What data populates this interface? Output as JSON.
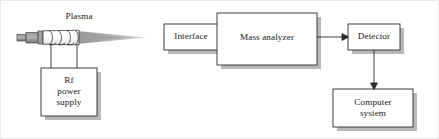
{
  "figure": {
    "background": "#ffffff",
    "line_color": "#2b2b2b",
    "shadow_color": "#b9b9b9",
    "plasma_gray": "#a8a8a8",
    "torch_gray": "#8c8c8c"
  },
  "annotations": {
    "plasma_label": "Plasma"
  },
  "blocks": [
    {
      "id": "rf-power-supply",
      "label": "Rf\npower\nsupply",
      "x": 40,
      "y": 67,
      "w": 56,
      "h": 48
    },
    {
      "id": "interface",
      "label": "Interface",
      "x": 163,
      "y": 23,
      "w": 54,
      "h": 26
    },
    {
      "id": "mass-analyzer",
      "label": "Mass analyzer",
      "x": 216,
      "y": 12,
      "w": 100,
      "h": 52
    },
    {
      "id": "detector",
      "label": "Detector",
      "x": 347,
      "y": 23,
      "w": 52,
      "h": 26
    },
    {
      "id": "computer-system",
      "label": "Computer\nsystem",
      "x": 332,
      "y": 88,
      "w": 80,
      "h": 38
    }
  ],
  "connectors": [
    {
      "id": "mass-analyzer-to-detector",
      "type": "arrow",
      "from": "mass-analyzer",
      "to": "detector",
      "direction": "right"
    },
    {
      "id": "detector-to-computer-system",
      "type": "arrow",
      "from": "detector",
      "to": "computer-system",
      "direction": "down"
    },
    {
      "id": "torch-to-rf-left",
      "type": "line",
      "from": "torch-coil",
      "to": "rf-power-supply"
    },
    {
      "id": "torch-to-rf-right",
      "type": "line",
      "from": "torch-coil",
      "to": "rf-power-supply"
    }
  ],
  "torch": {
    "id": "icp-torch",
    "coil_turns": 4,
    "flame_label": "plasma-flame"
  }
}
